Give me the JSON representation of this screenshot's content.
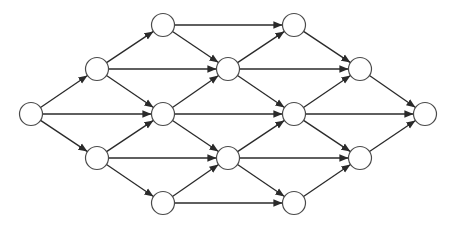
{
  "diagram": {
    "type": "directed-graph",
    "node_radius": 11.5,
    "colors": {
      "edge": "#2a2a2a",
      "node_stroke": "#4a4a4a",
      "node_fill": "#ffffff",
      "background": "#ffffff"
    },
    "nodes": [
      {
        "id": "A",
        "x": 31,
        "y": 114
      },
      {
        "id": "B1",
        "x": 97,
        "y": 69
      },
      {
        "id": "B2",
        "x": 97,
        "y": 158
      },
      {
        "id": "C1",
        "x": 163,
        "y": 25
      },
      {
        "id": "C2",
        "x": 163,
        "y": 114
      },
      {
        "id": "C3",
        "x": 163,
        "y": 203
      },
      {
        "id": "D1",
        "x": 228,
        "y": 69
      },
      {
        "id": "D2",
        "x": 228,
        "y": 158
      },
      {
        "id": "E1",
        "x": 294,
        "y": 25
      },
      {
        "id": "E2",
        "x": 294,
        "y": 114
      },
      {
        "id": "E3",
        "x": 294,
        "y": 203
      },
      {
        "id": "F1",
        "x": 360,
        "y": 69
      },
      {
        "id": "F2",
        "x": 360,
        "y": 158
      },
      {
        "id": "G",
        "x": 425,
        "y": 114
      }
    ],
    "edges": [
      [
        "A",
        "B1"
      ],
      [
        "A",
        "C2"
      ],
      [
        "A",
        "B2"
      ],
      [
        "B1",
        "C1"
      ],
      [
        "B1",
        "D1"
      ],
      [
        "B1",
        "C2"
      ],
      [
        "B2",
        "C2"
      ],
      [
        "B2",
        "D2"
      ],
      [
        "B2",
        "C3"
      ],
      [
        "C1",
        "E1"
      ],
      [
        "C1",
        "D1"
      ],
      [
        "C2",
        "D1"
      ],
      [
        "C2",
        "E2"
      ],
      [
        "C2",
        "D2"
      ],
      [
        "C3",
        "D2"
      ],
      [
        "C3",
        "E3"
      ],
      [
        "D1",
        "E1"
      ],
      [
        "D1",
        "F1"
      ],
      [
        "D1",
        "E2"
      ],
      [
        "D2",
        "E2"
      ],
      [
        "D2",
        "F2"
      ],
      [
        "D2",
        "E3"
      ],
      [
        "E1",
        "F1"
      ],
      [
        "E2",
        "F1"
      ],
      [
        "E2",
        "G"
      ],
      [
        "E2",
        "F2"
      ],
      [
        "E3",
        "F2"
      ],
      [
        "F1",
        "G"
      ],
      [
        "F2",
        "G"
      ]
    ]
  }
}
